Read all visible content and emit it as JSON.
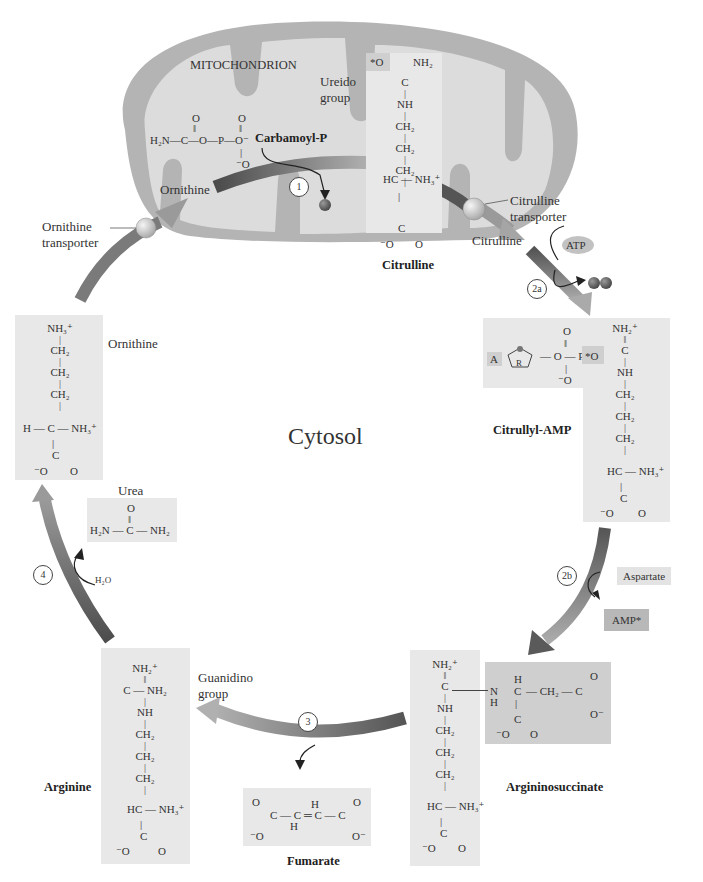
{
  "compartments": {
    "mitochondrion": "MITOCHONDRION",
    "cytosol": "Cytosol"
  },
  "colors": {
    "mito_outer": "#b4b4b4",
    "mito_inner": "#dcdcdc",
    "box_light": "#e8e8e8",
    "box_dark": "#c8c8c8",
    "arrow_dark": "#555555",
    "arrow_light": "#b0b0b0",
    "phosphate": "#6a6a6a"
  },
  "steps": [
    {
      "id": "1",
      "label": "1"
    },
    {
      "id": "2a",
      "label": "2a"
    },
    {
      "id": "2b",
      "label": "2b"
    },
    {
      "id": "3",
      "label": "3"
    },
    {
      "id": "4",
      "label": "4"
    }
  ],
  "labels": {
    "ornithine_in_mito": "Ornithine",
    "ornithine_transporter_1": "Ornithine",
    "ornithine_transporter_2": "transporter",
    "citrulline_transporter_1": "Citrulline",
    "citrulline_transporter_2": "transporter",
    "citrulline_cytosol": "Citrulline",
    "ureido_1": "Ureido",
    "ureido_2": "group",
    "guanidino_1": "Guanidino",
    "guanidino_2": "group",
    "urea": "Urea",
    "ornithine_side": "Ornithine",
    "water": "H₂O",
    "atp": "ATP",
    "ppi_1": "P",
    "ppi_2": "P",
    "pi": "P",
    "aspartate": "Aspartate",
    "amp": "AMP*",
    "adenine": "A",
    "ribose": "R"
  },
  "molecules": {
    "carbamoyl_p": {
      "name": "Carbamoyl-P",
      "formula": "H₂N—C—O—P—O⁻"
    },
    "citrulline": {
      "name": "Citrulline"
    },
    "citrullyl_amp": {
      "name": "Citrullyl-AMP"
    },
    "argininosuccinate": {
      "name": "Argininosuccinate"
    },
    "arginine": {
      "name": "Arginine"
    },
    "fumarate": {
      "name": "Fumarate"
    },
    "urea": {
      "formula": "H₂N — C — NH₂"
    },
    "ornithine": {
      "name": "Ornithine"
    }
  },
  "chem": {
    "o": "O",
    "star_o": "*O",
    "o_minus": "⁻O",
    "o_minus_r": "O⁻",
    "c": "C",
    "nh": "NH",
    "ch2": "CH₂",
    "nh2": "NH₂",
    "nh2p": "NH₂⁺",
    "nh3p": "NH₃⁺",
    "hc_nh3": "HC — NH₃⁺",
    "h_c_nh3": "H — C — NH₃⁺",
    "c_nh2": "C — NH₂",
    "double": "‖",
    "single": "|",
    "h": "H",
    "n_h": "N",
    "ch2_c": "— CH₂ — C",
    "fum_chain": "C — C ═ C — C",
    "h2n": "H₂N —",
    "dash_o_dash_p": "— O — P —",
    "p": "P"
  }
}
